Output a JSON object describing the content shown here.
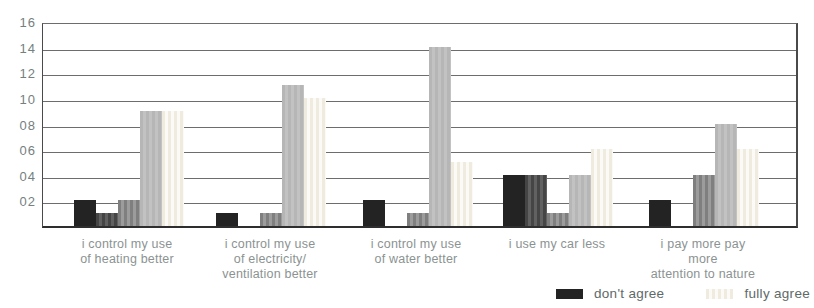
{
  "chart_data": {
    "type": "bar",
    "title": "",
    "xlabel": "",
    "ylabel": "",
    "ylim": [
      0,
      16
    ],
    "grid": "horizontal",
    "y_ticks": [
      "16",
      "14",
      "12",
      "10",
      "08",
      "06",
      "04",
      "02"
    ],
    "y_tick_values": [
      16,
      14,
      12,
      10,
      8,
      6,
      4,
      2
    ],
    "categories": [
      "i control my use\nof heating better",
      "i control my use\nof electricity/\nventilation better",
      "i control my use\nof water better",
      "i use my car less",
      "i pay more pay more\nattention to nature"
    ],
    "series": [
      {
        "name": "don't agree",
        "values": [
          2,
          1,
          2,
          4,
          2
        ],
        "texture": "solid",
        "color": "#232323",
        "color2": "#232323"
      },
      {
        "name": "",
        "values": [
          1,
          0,
          0,
          4,
          0
        ],
        "texture": "striped",
        "color": "#454545",
        "color2": "#616161"
      },
      {
        "name": "",
        "values": [
          2,
          1,
          1,
          1,
          4
        ],
        "texture": "striped",
        "color": "#7f7f7f",
        "color2": "#9c9c9c"
      },
      {
        "name": "",
        "values": [
          9,
          11,
          14,
          4,
          8
        ],
        "texture": "striped",
        "color": "#b6b6b6",
        "color2": "#c2c2c2"
      },
      {
        "name": "fully agree",
        "values": [
          9,
          10,
          5,
          6,
          6
        ],
        "texture": "striped",
        "color": "#efecdf",
        "color2": "#fbfaf6"
      }
    ],
    "legend": {
      "position": "bottom-right",
      "items": [
        {
          "label": "don't agree",
          "series_index": 0
        },
        {
          "label": "fully agree",
          "series_index": 4
        }
      ]
    }
  },
  "colors": {
    "background": "#ffffff",
    "gridline": "#6d6d6d",
    "axis": "#2e2e2e",
    "tick_text": "#75807f",
    "category_text": "#8b9392",
    "legend_text": "#5e6a69"
  }
}
